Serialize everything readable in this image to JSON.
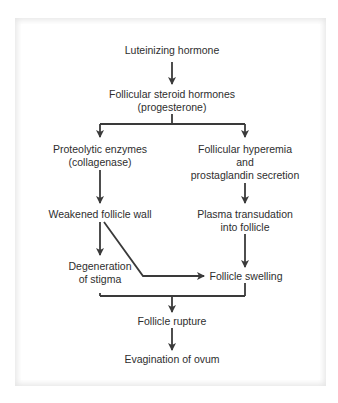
{
  "diagram": {
    "type": "flowchart",
    "nodes": {
      "lh": "Luteinizing hormone",
      "steroid_1": "Follicular steroid hormones",
      "steroid_2": "(progesterone)",
      "proteolytic_1": "Proteolytic enzymes",
      "proteolytic_2": "(collagenase)",
      "hyperemia_1": "Follicular hyperemia",
      "hyperemia_2": "and",
      "hyperemia_3": "prostaglandin secretion",
      "weakened": "Weakened follicle wall",
      "plasma_1": "Plasma transudation",
      "plasma_2": "into follicle",
      "degeneration_1": "Degeneration",
      "degeneration_2": "of stigma",
      "swelling": "Follicle swelling",
      "rupture": "Follicle rupture",
      "evagination": "Evagination of ovum"
    },
    "edges": [
      [
        "Luteinizing hormone",
        "Follicular steroid hormones (progesterone)"
      ],
      [
        "Follicular steroid hormones (progesterone)",
        "Proteolytic enzymes (collagenase)"
      ],
      [
        "Follicular steroid hormones (progesterone)",
        "Follicular hyperemia and prostaglandin secretion"
      ],
      [
        "Proteolytic enzymes (collagenase)",
        "Weakened follicle wall"
      ],
      [
        "Follicular hyperemia and prostaglandin secretion",
        "Plasma transudation into follicle"
      ],
      [
        "Weakened follicle wall",
        "Degeneration of stigma"
      ],
      [
        "Weakened follicle wall",
        "Follicle swelling"
      ],
      [
        "Plasma transudation into follicle",
        "Follicle swelling"
      ],
      [
        "Degeneration of stigma",
        "Follicle rupture"
      ],
      [
        "Follicle swelling",
        "Follicle rupture"
      ],
      [
        "Follicle rupture",
        "Evagination of ovum"
      ]
    ],
    "colors": {
      "frame": "#e6e6e6",
      "line": "#3a3a3a",
      "text": "#2e2e2e"
    }
  }
}
